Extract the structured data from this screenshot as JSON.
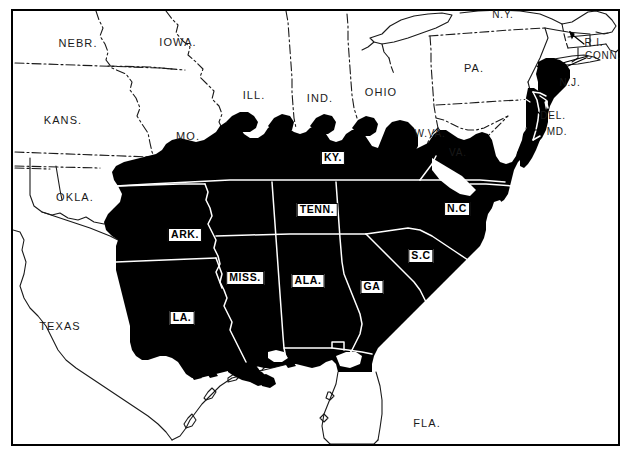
{
  "map": {
    "title": "Map of the eastern United States with a solid black shaded region covering the Southern states",
    "colors": {
      "paper": "#ffffff",
      "ink": "#000000",
      "shaded_region": "#000000",
      "internal_border_line": "#ffffff",
      "external_border_line": "#1a1a1a",
      "frame": "#000000"
    },
    "frame": {
      "x": 11,
      "y": 9,
      "width": 609,
      "height": 437,
      "stroke_width": 2
    },
    "legend_note": "States rendered in solid black are within the mapped region; states drawn in white outline are outside it."
  },
  "labels_shaded": [
    {
      "name": "kentucky",
      "text": "KY.",
      "x": 333,
      "y": 158
    },
    {
      "name": "tennessee",
      "text": "TENN.",
      "x": 317,
      "y": 210
    },
    {
      "name": "arkansas",
      "text": "ARK.",
      "x": 185,
      "y": 235
    },
    {
      "name": "north-carolina",
      "text": "N.C",
      "x": 457,
      "y": 209
    },
    {
      "name": "south-carolina",
      "text": "S.C",
      "x": 421,
      "y": 256
    },
    {
      "name": "mississippi",
      "text": "MISS.",
      "x": 245,
      "y": 278
    },
    {
      "name": "alabama",
      "text": "ALA.",
      "x": 308,
      "y": 281
    },
    {
      "name": "georgia",
      "text": "GA",
      "x": 372,
      "y": 287
    },
    {
      "name": "louisiana",
      "text": "LA.",
      "x": 182,
      "y": 318
    }
  ],
  "labels_plain": [
    {
      "name": "nebraska",
      "text": "NEBR.",
      "x": 78,
      "y": 43,
      "size": "normal"
    },
    {
      "name": "iowa",
      "text": "IOWA.",
      "x": 178,
      "y": 42,
      "size": "normal"
    },
    {
      "name": "new-york",
      "text": "N.Y.",
      "x": 503,
      "y": 14,
      "size": "small"
    },
    {
      "name": "rhode-island",
      "text": "R.I.",
      "x": 594,
      "y": 42,
      "size": "small"
    },
    {
      "name": "connecticut",
      "text": "CONN.",
      "x": 603,
      "y": 55,
      "size": "small"
    },
    {
      "name": "illinois",
      "text": "ILL.",
      "x": 254,
      "y": 95,
      "size": "normal"
    },
    {
      "name": "indiana",
      "text": "IND.",
      "x": 320,
      "y": 98,
      "size": "normal"
    },
    {
      "name": "ohio",
      "text": "OHIO",
      "x": 381,
      "y": 92,
      "size": "normal"
    },
    {
      "name": "pennsylvania",
      "text": "PA.",
      "x": 474,
      "y": 68,
      "size": "normal"
    },
    {
      "name": "new-jersey",
      "text": "N.J.",
      "x": 570,
      "y": 82,
      "size": "small"
    },
    {
      "name": "kansas",
      "text": "KANS.",
      "x": 63,
      "y": 120,
      "size": "normal"
    },
    {
      "name": "missouri",
      "text": "MO.",
      "x": 188,
      "y": 136,
      "size": "normal"
    },
    {
      "name": "west-virginia",
      "text": "W.VA.",
      "x": 430,
      "y": 133,
      "size": "small"
    },
    {
      "name": "delaware",
      "text": "DEL.",
      "x": 553,
      "y": 115,
      "size": "small"
    },
    {
      "name": "maryland",
      "text": "MD.",
      "x": 557,
      "y": 131,
      "size": "small"
    },
    {
      "name": "virginia",
      "text": "VA.",
      "x": 458,
      "y": 152,
      "size": "small"
    },
    {
      "name": "oklahoma",
      "text": "OKLA.",
      "x": 75,
      "y": 197,
      "size": "normal"
    },
    {
      "name": "texas",
      "text": "TEXAS",
      "x": 60,
      "y": 326,
      "size": "normal"
    },
    {
      "name": "florida",
      "text": "FLA.",
      "x": 427,
      "y": 423,
      "size": "normal"
    }
  ]
}
